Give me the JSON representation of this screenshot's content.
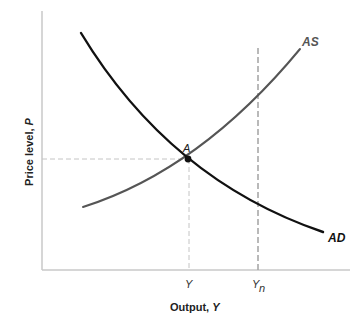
{
  "diagram": {
    "type": "AD-AS model",
    "axes": {
      "x_title": "Output, ",
      "x_title_var": "Y",
      "y_title": "Price level, ",
      "y_title_var": "P"
    },
    "curves": [
      {
        "id": "AD",
        "label": "AD",
        "color": "#111111",
        "slope": "downward"
      },
      {
        "id": "AS",
        "label": "AS",
        "color": "#555555",
        "slope": "upward"
      }
    ],
    "equilibrium": {
      "label": "A",
      "at": "intersection of AD and AS"
    },
    "x_ticks": [
      {
        "label": "Y",
        "subscript": ""
      },
      {
        "label": "Y",
        "subscript": "n"
      }
    ],
    "guides": {
      "equilibrium_price_line": "dashed horizontal from P axis to A",
      "equilibrium_output_line": "dashed vertical from A to Y",
      "natural_output_line": "dashed vertical at Yn"
    },
    "colors": {
      "axis": "#c8c8c8",
      "guide": "#c4c4c4",
      "natural_output": "#a8a8a8"
    }
  }
}
